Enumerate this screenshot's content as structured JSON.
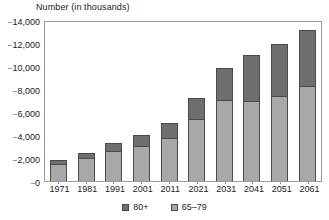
{
  "chart_data": {
    "type": "bar",
    "stacked": true,
    "title": "Number (in thousands)",
    "xlabel": "",
    "ylabel": "Number (in thousands)",
    "ylim": [
      0,
      14000
    ],
    "ytick_step": 2000,
    "yticks": [
      "14,000",
      "12,000",
      "10,000",
      "8,000",
      "6,000",
      "4,000",
      "2,000",
      "0"
    ],
    "ytick_values": [
      14000,
      12000,
      10000,
      8000,
      6000,
      4000,
      2000,
      0
    ],
    "grid": false,
    "legend_position": "bottom",
    "categories": [
      "1971",
      "1981",
      "1991",
      "2001",
      "2011",
      "2021",
      "2031",
      "2041",
      "2051",
      "2061"
    ],
    "series": [
      {
        "name": "65–79",
        "color": "#a8a8a8",
        "values": [
          1500,
          2000,
          2600,
          3050,
          3700,
          5400,
          7050,
          6950,
          7400,
          8250
        ]
      },
      {
        "name": "80+",
        "color": "#6e6e6e",
        "values": [
          300,
          450,
          700,
          950,
          1350,
          1850,
          2750,
          4050,
          4550,
          4850
        ]
      }
    ],
    "totals": [
      1800,
      2450,
      3300,
      4000,
      5050,
      7250,
      9800,
      11000,
      11950,
      13100
    ],
    "legend": [
      {
        "label": "80+",
        "color": "#6e6e6e"
      },
      {
        "label": "65–79",
        "color": "#a8a8a8"
      }
    ]
  },
  "colors": {
    "series_80_plus": "#6e6e6e",
    "series_65_79": "#a8a8a8",
    "axis": "#9a9a9a",
    "bar_outline": "#4a4a4a",
    "text": "#1a1a1a",
    "background": "#ffffff"
  }
}
